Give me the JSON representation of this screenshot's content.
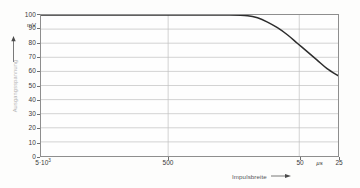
{
  "chart_data": {
    "type": "line",
    "title": "",
    "subtitle": "",
    "xlabel": "Impulsbreite",
    "ylabel": "Ausgangsspannung",
    "x_unit": "µs",
    "y_unit": "mV",
    "ylim": [
      0,
      100
    ],
    "y_ticks": [
      0,
      10,
      20,
      30,
      40,
      50,
      60,
      70,
      80,
      90,
      100
    ],
    "y_tick_labels": [
      "0",
      "10",
      "20",
      "30",
      "40",
      "50",
      "60",
      "70",
      "80",
      "90",
      "100"
    ],
    "x_axis_scale": "log-reversed",
    "x_tick_labels": [
      "5·10³",
      "500",
      "50",
      "25"
    ],
    "x_tick_positions_px": [
      40,
      168,
      300,
      339
    ],
    "x_gridline_labels": [
      "500",
      "50"
    ],
    "grid": "horizontal-and-vertical",
    "legend": "none",
    "series": [
      {
        "name": "Ausgangsspannung",
        "color": "#2d2d2d",
        "points": [
          {
            "x_px": 40,
            "y": 100
          },
          {
            "x_px": 80,
            "y": 100
          },
          {
            "x_px": 120,
            "y": 100
          },
          {
            "x_px": 160,
            "y": 100
          },
          {
            "x_px": 200,
            "y": 100
          },
          {
            "x_px": 230,
            "y": 100
          },
          {
            "x_px": 248,
            "y": 99.5
          },
          {
            "x_px": 258,
            "y": 98
          },
          {
            "x_px": 268,
            "y": 95
          },
          {
            "x_px": 278,
            "y": 91
          },
          {
            "x_px": 288,
            "y": 86
          },
          {
            "x_px": 298,
            "y": 80
          },
          {
            "x_px": 308,
            "y": 74
          },
          {
            "x_px": 318,
            "y": 68
          },
          {
            "x_px": 328,
            "y": 62
          },
          {
            "x_px": 339,
            "y": 57
          }
        ]
      }
    ],
    "annotations": []
  },
  "axes": {
    "y": {
      "unit_label": "mV",
      "title": "Ausgangsspannung",
      "labels": [
        "100",
        "90",
        "80",
        "70",
        "60",
        "50",
        "40",
        "30",
        "20",
        "10",
        "0"
      ]
    },
    "x": {
      "unit_label": "µs",
      "title": "Impulsbreite",
      "arrow": "⟶",
      "labels": [
        "5·10³",
        "500",
        "50",
        "25"
      ],
      "first_label_base": "5·10",
      "first_label_exponent": "3"
    }
  },
  "colors": {
    "curve": "#2d2d2d",
    "grid": "#bfbfbf",
    "frame": "#8e8e8e",
    "background": "#fdfdfc",
    "text": "#3a3a3a",
    "faint_text": "#b2b2b2"
  }
}
